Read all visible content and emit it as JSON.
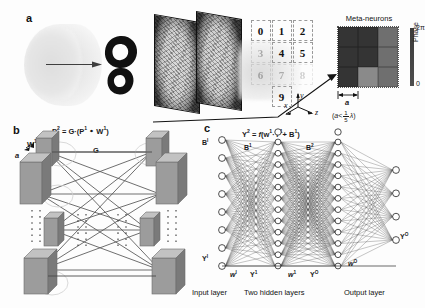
{
  "figure": {
    "panels": {
      "a": {
        "letter": "a"
      },
      "b": {
        "letter": "b"
      },
      "c": {
        "letter": "c"
      }
    }
  },
  "panel_a": {
    "letter": "a",
    "beam_label": "",
    "arrow_name": "propagation-arrow"
  },
  "panel_mid": {
    "meta_title": "Meta-neurons",
    "colorbar": {
      "top_label": "2π",
      "bottom_label": "0",
      "axis_label": "Phase"
    },
    "digits": [
      "0",
      "1",
      "2",
      "3",
      "4",
      "5",
      "6",
      "7",
      "8",
      "9"
    ],
    "digit_opacity": [
      1,
      1,
      1,
      0.3,
      1,
      1,
      0.3,
      0.28,
      0.2,
      1
    ],
    "lattice_label": "a",
    "lattice_condition": "(a< 1/5 λ)",
    "lattice_condition_parts": {
      "prefix": "(",
      "var": "a",
      "op": "<",
      "num": "1",
      "den": "5",
      "lambda": "λ",
      "suffix": ")"
    },
    "axes": {
      "x": "x",
      "y": "y",
      "z": "z"
    },
    "meta_cells_gray": [
      [
        "#343434",
        "#343434",
        "#6f6f6f"
      ],
      [
        "#343434",
        "#343434",
        "#6f6f6f"
      ],
      [
        "#343434",
        "#8a8a8a",
        "#6f6f6f"
      ]
    ]
  },
  "panel_b": {
    "letter": "b",
    "equation": "P² = G ·(P¹ ∘ W¹)",
    "eq_parts": {
      "lhs": "P",
      "lhs_sup": "2",
      "eq": "=",
      "g": "G",
      "dot": "·",
      "open": "(",
      "p1": "P",
      "p1_sup": "1",
      "hadamard": "∘",
      "w1": "W",
      "w1_sup": "1",
      "close": ")"
    },
    "labels": {
      "w1": "W¹",
      "w2": "W²",
      "g": "G",
      "a": "a"
    },
    "left_boxes": 4,
    "right_boxes": 4,
    "box_fill": "#9c9c9c",
    "box_top": "#c2c2c2",
    "box_side": "#7a7a7a"
  },
  "panel_c": {
    "letter": "c",
    "equation": "Y² = f (w¹·Y¹+ B¹)",
    "eq_parts": {
      "y": "Y",
      "y_sup": "2",
      "eq": "=",
      "f": "f",
      "open": "(",
      "w": "w",
      "w_sup": "1",
      "dot": "·",
      "y1": "Y",
      "y1_sup": "1",
      "plus": "+",
      "b": "B",
      "b_sup": "1",
      "close": ")"
    },
    "node_counts": {
      "input": 8,
      "hidden1": 12,
      "hidden2": 12,
      "output": 4
    },
    "labels": {
      "b_input": "B",
      "b_input_sup": "I",
      "b1": "B",
      "b1_sup": "1",
      "b2": "B",
      "b2_sup": "2",
      "y_input": "Y",
      "y_input_sup": "I",
      "w0_left": "w",
      "w0_left_sup": "I",
      "y1": "Y",
      "y1_sup": "1",
      "w1": "w",
      "w1_sup": "1",
      "y0": "Y",
      "y0_sup": "O",
      "w_out": "w",
      "w_out_sup": "O",
      "y_out": "Y",
      "y_out_sup": "O"
    },
    "footer": {
      "input": "Input layer",
      "hidden": "Two hidden layers",
      "output": "Output layer"
    }
  },
  "colors": {
    "ink": "#1a1a1a",
    "node_stroke": "#222222",
    "edge": "#555555",
    "box_gray": "#9c9c9c",
    "meta_dark": "#343434",
    "meta_mid": "#6f6f6f",
    "meta_light": "#8a8a8a",
    "background": "#fdfdfd"
  }
}
